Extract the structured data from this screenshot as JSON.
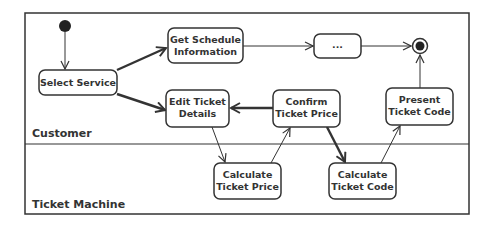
{
  "diagram": {
    "type": "uml-activity-diagram",
    "swimlanes": [
      {
        "id": "customer",
        "label": "Customer"
      },
      {
        "id": "machine",
        "label": "Ticket Machine"
      }
    ],
    "nodes": {
      "select_service": {
        "lines": [
          "Select Service"
        ],
        "lane": "customer"
      },
      "get_schedule": {
        "lines": [
          "Get Schedule",
          "Information"
        ],
        "lane": "customer"
      },
      "ellipsis": {
        "lines": [
          "..."
        ],
        "lane": "customer"
      },
      "edit_ticket": {
        "lines": [
          "Edit Ticket",
          "Details"
        ],
        "lane": "customer"
      },
      "confirm_price": {
        "lines": [
          "Confirm",
          "Ticket Price"
        ],
        "lane": "customer"
      },
      "present_code": {
        "lines": [
          "Present",
          "Ticket Code"
        ],
        "lane": "customer"
      },
      "calc_price": {
        "lines": [
          "Calculate",
          "Ticket Price"
        ],
        "lane": "machine"
      },
      "calc_code": {
        "lines": [
          "Calculate",
          "Ticket Code"
        ],
        "lane": "machine"
      }
    },
    "edges": [
      {
        "from": "initial",
        "to": "select_service",
        "weight": "thin"
      },
      {
        "from": "select_service",
        "to": "get_schedule",
        "weight": "thick"
      },
      {
        "from": "select_service",
        "to": "edit_ticket",
        "weight": "thick"
      },
      {
        "from": "get_schedule",
        "to": "ellipsis",
        "weight": "thin"
      },
      {
        "from": "ellipsis",
        "to": "final",
        "weight": "thin"
      },
      {
        "from": "edit_ticket",
        "to": "calc_price",
        "weight": "thin"
      },
      {
        "from": "calc_price",
        "to": "confirm_price",
        "weight": "thin"
      },
      {
        "from": "confirm_price",
        "to": "edit_ticket",
        "weight": "thick"
      },
      {
        "from": "confirm_price",
        "to": "calc_code",
        "weight": "thick"
      },
      {
        "from": "calc_code",
        "to": "present_code",
        "weight": "thin"
      },
      {
        "from": "present_code",
        "to": "final",
        "weight": "thin"
      }
    ],
    "colors": {
      "stroke": "#333333",
      "fill": "#ffffff",
      "text": "#333333"
    }
  }
}
